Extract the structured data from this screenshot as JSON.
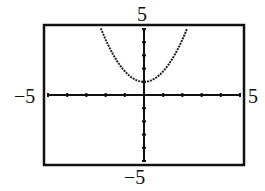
{
  "chart_data": {
    "type": "line",
    "title": "",
    "xlabel": "",
    "ylabel": "",
    "xlim": [
      -5,
      5
    ],
    "ylim": [
      -5,
      5
    ],
    "tick_labels": {
      "x_min": "−5",
      "x_max": "5",
      "y_min": "−5",
      "y_max": "5"
    },
    "xticks": [
      -5,
      -4,
      -3,
      -2,
      -1,
      0,
      1,
      2,
      3,
      4,
      5
    ],
    "yticks": [
      -5,
      -4,
      -3,
      -2,
      -1,
      0,
      1,
      2,
      3,
      4,
      5
    ],
    "grid": false,
    "series": [
      {
        "name": "f(x)",
        "equation_estimate": "y = 0.8x^2 + 1",
        "x": [
          -2.25,
          -2,
          -1.5,
          -1,
          -0.5,
          0,
          0.5,
          1,
          1.5,
          2,
          2.25
        ],
        "y": [
          5.05,
          4.2,
          2.8,
          1.8,
          1.2,
          1.0,
          1.2,
          1.8,
          2.8,
          4.2,
          5.05
        ]
      }
    ]
  }
}
